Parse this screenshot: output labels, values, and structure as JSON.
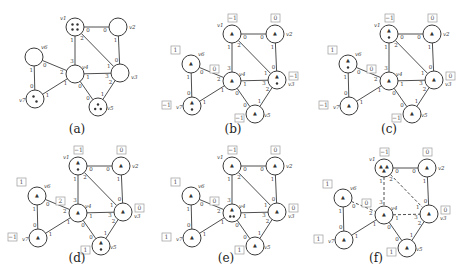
{
  "figure": {
    "colors": {
      "stroke": "#3a3a3a",
      "box": "#9a9a9a",
      "token": "#333333",
      "background": "#ffffff"
    },
    "vertex_radius": 9,
    "base_vertices": {
      "v1": [
        75,
        27
      ],
      "v2": [
        118,
        27
      ],
      "v3": [
        120,
        73
      ],
      "v4": [
        75,
        74
      ],
      "v5": [
        98,
        107
      ],
      "v6": [
        34,
        57
      ],
      "v7": [
        35,
        99
      ]
    },
    "edges": [
      {
        "id": "v1-v2",
        "a": "v1",
        "b": "v2",
        "pa": "0",
        "pb": "0"
      },
      {
        "id": "v1-v4",
        "a": "v1",
        "b": "v4",
        "pa": "1",
        "pb": "3"
      },
      {
        "id": "v1-v3",
        "a": "v1",
        "b": "v3",
        "pa": "2",
        "pb": "1"
      },
      {
        "id": "v2-v3",
        "a": "v2",
        "b": "v3",
        "pa": "1",
        "pb": "0"
      },
      {
        "id": "v4-v3",
        "a": "v4",
        "b": "v3",
        "pa": "1",
        "pb": "3"
      },
      {
        "id": "v6-v4",
        "a": "v6",
        "b": "v4",
        "pa": "0",
        "pb": "2"
      },
      {
        "id": "v6-v7",
        "a": "v6",
        "b": "v7",
        "pa": "1",
        "pb": "0"
      },
      {
        "id": "v7-v4",
        "a": "v7",
        "b": "v4",
        "pa": "1",
        "pb": "1"
      },
      {
        "id": "v4-v5",
        "a": "v4",
        "b": "v5",
        "pa": "0",
        "pb": "0"
      },
      {
        "id": "v3-v5",
        "a": "v3",
        "b": "v5",
        "pa": "2",
        "pb": "1"
      }
    ],
    "panels": [
      {
        "id": "a",
        "caption": "(a)",
        "offset": [
          0,
          0
        ],
        "caption_pos": [
          77,
          133
        ],
        "tokens": {
          "v1": 4,
          "v7": 2,
          "v5": 3
        },
        "agents": {},
        "boxes": {},
        "dashed": []
      },
      {
        "id": "b",
        "caption": "(b)",
        "offset": [
          157,
          7
        ],
        "caption_pos": [
          233,
          133
        ],
        "tokens": {
          "v3": 1,
          "v7": 1
        },
        "agents": {
          "v1": 1,
          "v2": 1,
          "v3": 1,
          "v4": 1,
          "v5": 1,
          "v6": 1,
          "v7": 1
        },
        "boxes": {
          "v1": "−1",
          "v2": "0",
          "v3": "−1",
          "v4": "0",
          "v5": "−1",
          "v6": "1",
          "v7": "−1"
        },
        "dashed": []
      },
      {
        "id": "c",
        "caption": "(c)",
        "offset": [
          314,
          7
        ],
        "caption_pos": [
          389,
          133
        ],
        "tokens": {
          "v1": 1,
          "v6": 1
        },
        "agents": {
          "v1": 1,
          "v2": 1,
          "v3": 1,
          "v4": 1,
          "v5": 1,
          "v6": 1,
          "v7": 1
        },
        "boxes": {
          "v1": "−1",
          "v2": "0",
          "v3": "0",
          "v4": "0",
          "v5": "−1",
          "v6": "1",
          "v7": "−1"
        },
        "dashed": []
      },
      {
        "id": "d",
        "caption": "(d)",
        "offset": [
          3,
          139
        ],
        "caption_pos": [
          77,
          262
        ],
        "tokens": {
          "v1": 1,
          "v5": 1
        },
        "agents": {
          "v1": 1,
          "v2": 1,
          "v3": 1,
          "v4": 1,
          "v5": 1,
          "v6": 1,
          "v7": 1
        },
        "boxes": {
          "v1": "−1",
          "v2": "0",
          "v3": "0",
          "v4": "2",
          "v5": "1",
          "v6": "1",
          "v7": "−1"
        },
        "dashed": []
      },
      {
        "id": "e",
        "caption": "(e)",
        "offset": [
          157,
          139
        ],
        "caption_pos": [
          226,
          262
        ],
        "tokens": {
          "v4": 2
        },
        "agents": {
          "v1": 1,
          "v2": 1,
          "v3": 1,
          "v4": 1,
          "v5": 1,
          "v6": 1,
          "v7": 1
        },
        "boxes": {
          "v1": "−1",
          "v2": "0",
          "v3": "0",
          "v4": "0",
          "v5": "1",
          "v6": "1",
          "v7": "1"
        },
        "dashed": []
      },
      {
        "id": "f",
        "caption": "(f)",
        "offset": [
          309,
          141
        ],
        "caption_pos": [
          376,
          262
        ],
        "tokens": {},
        "agents": {
          "v1": 3,
          "v2": 1,
          "v3": 1,
          "v4": 1,
          "v5": 1,
          "v6": 1,
          "v7": 1
        },
        "boxes": {
          "v1": "−1",
          "v2": "0",
          "v3": "0",
          "v4": "0",
          "v5": "1",
          "v6": "1",
          "v7": "1"
        },
        "dashed": [
          "v1-v4",
          "v1-v3",
          "v4-v3",
          "v6-v4"
        ]
      }
    ],
    "vertex_labels": {
      "v1": "v1",
      "v2": "v2",
      "v3": "v3",
      "v4": "v4",
      "v5": "v5",
      "v6": "v6",
      "v7": "v7"
    },
    "vertex_label_offsets": {
      "v1": [
        -15,
        -7
      ],
      "v2": [
        11,
        2
      ],
      "v3": [
        11,
        6
      ],
      "v4": [
        7,
        -5
      ],
      "v5": [
        9,
        3
      ],
      "v6": [
        7,
        -8
      ],
      "v7": [
        -16,
        3
      ]
    },
    "box_offsets": {
      "v1": [
        -4,
        -20
      ],
      "v2": [
        -4,
        -20
      ],
      "v3": [
        12,
        -8
      ],
      "v4": [
        -22,
        -16
      ],
      "v5": [
        -20,
        0
      ],
      "v6": [
        -20,
        -18
      ],
      "v7": [
        -30,
        -5
      ]
    }
  }
}
